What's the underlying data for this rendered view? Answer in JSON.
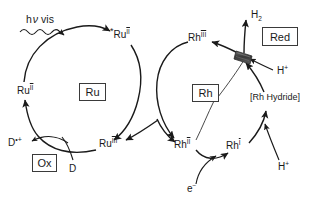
{
  "diagram": {
    "ink_color": "#1a1a1a",
    "background": "#ffffff",
    "catalyst_fill": "#4d4d4d"
  },
  "light": {
    "h_symbol": "h",
    "nu_symbol": "ν",
    "vis_label": "vis",
    "full_label": "h ν vis",
    "wave_arrow": "squiggle-arrow"
  },
  "ru_cycle": {
    "center_label": "Ru",
    "species": {
      "ground": {
        "element": "Ru",
        "oxidation": "II",
        "label": "Ru II"
      },
      "excited": {
        "star": "*",
        "element": "Ru",
        "oxidation": "II",
        "label": "*Ru II"
      },
      "oxidized": {
        "element": "Ru",
        "oxidation": "III",
        "label": "Ru III"
      }
    }
  },
  "rh_cycle": {
    "center_label": "Rh",
    "species": {
      "rh3": {
        "element": "Rh",
        "oxidation": "III",
        "label": "Rh III"
      },
      "rh2": {
        "element": "Rh",
        "oxidation": "II",
        "label": "Rh II"
      },
      "rh1": {
        "element": "Rh",
        "oxidation": "I",
        "label": "Rh I"
      }
    },
    "hydride_label": "[Rh Hydride]",
    "hydride_open_bracket": "[",
    "hydride_text": "Rh Hydride",
    "hydride_close_bracket": "]"
  },
  "donor": {
    "donor_label": "D",
    "radical_cation_label": "D•+",
    "radical_cation_base": "D",
    "radical_cation_sup": "•+",
    "ox_box_label": "Ox"
  },
  "products": {
    "hydrogen_base": "H",
    "hydrogen_sub": "2",
    "hydrogen_label": "H2",
    "proton_base": "H",
    "proton_sup": "+",
    "proton_label": "H+",
    "electron_base": "e",
    "electron_sup": "−",
    "electron_label": "e−",
    "red_box_label": "Red"
  }
}
